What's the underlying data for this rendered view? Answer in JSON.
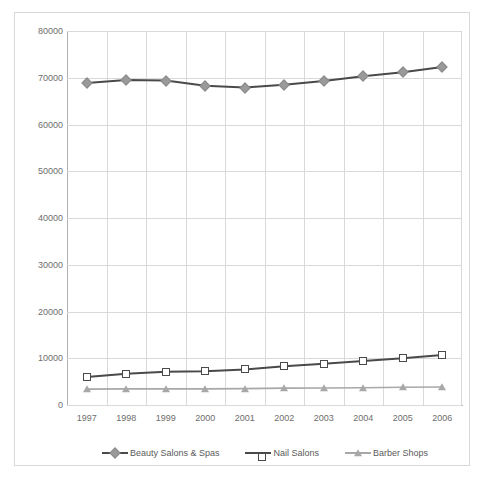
{
  "chart_data": {
    "type": "line",
    "title": "",
    "subtitle": "",
    "xlabel": "",
    "ylabel": "",
    "categories": [
      "1997",
      "1998",
      "1999",
      "2000",
      "2001",
      "2002",
      "2003",
      "2004",
      "2005",
      "2006"
    ],
    "x": [
      1997,
      1998,
      1999,
      2000,
      2001,
      2002,
      2003,
      2004,
      2005,
      2006
    ],
    "ylim": [
      0,
      80000
    ],
    "yticks": [
      0,
      10000,
      20000,
      30000,
      40000,
      50000,
      60000,
      70000,
      80000
    ],
    "ytick_labels": [
      "0",
      "10000",
      "20000",
      "30000",
      "40000",
      "50000",
      "60000",
      "70000",
      "80000"
    ],
    "grid": "horizontal-and-vertical",
    "legend_position": "bottom",
    "series": [
      {
        "name": "Beauty Salons & Spas",
        "marker": "diamond",
        "color": "#4a4a4a",
        "marker_color": "#9a9a9a",
        "values": [
          68900,
          69500,
          69400,
          68300,
          67900,
          68500,
          69300,
          70300,
          71200,
          72300
        ]
      },
      {
        "name": "Nail Salons",
        "marker": "open-square",
        "color": "#4a4a4a",
        "marker_color": "#ffffff",
        "values": [
          6000,
          6700,
          7100,
          7200,
          7600,
          8300,
          8800,
          9400,
          10000,
          10700
        ]
      },
      {
        "name": "Barber Shops",
        "marker": "triangle",
        "color": "#a8a8a8",
        "marker_color": "#a8a8a8",
        "values": [
          3400,
          3450,
          3450,
          3450,
          3500,
          3600,
          3650,
          3700,
          3800,
          3850
        ]
      }
    ]
  },
  "legend": {
    "items": [
      {
        "label": "Beauty Salons & Spas",
        "marker": "diamond-marker-icon"
      },
      {
        "label": "Nail Salons",
        "marker": "open-square-marker-icon"
      },
      {
        "label": "Barber Shops",
        "marker": "triangle-marker-icon"
      }
    ]
  },
  "colors": {
    "grid": "#d9d9d9",
    "axis": "#b0b0b0",
    "frame": "#d8d8d8",
    "tick_text": "#6e6e6e",
    "legend_text": "#5a5a5a",
    "dark_series": "#4a4a4a",
    "light_series": "#a8a8a8"
  }
}
